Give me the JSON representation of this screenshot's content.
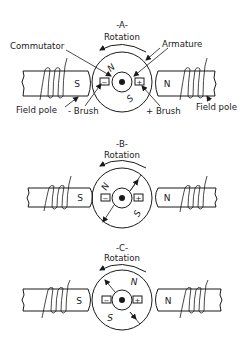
{
  "panels": [
    {
      "id": "A",
      "title": "-A-",
      "rotation_label": "Rotation",
      "field_pole_left_letter": "S",
      "field_pole_right_letter": "N",
      "armature_north": "N",
      "armature_south": "S",
      "brush_left_sign": "−",
      "brush_right_sign": "+",
      "callouts": {
        "commutator": "Commutator",
        "armature": "Armature",
        "field_pole_left": "Field pole",
        "field_pole_right": "Field pole",
        "neg_brush": "- Brush",
        "pos_brush": "+ Brush"
      }
    },
    {
      "id": "B",
      "title": "-B-",
      "rotation_label": "Rotation",
      "field_pole_left_letter": "S",
      "field_pole_right_letter": "N",
      "armature_north": "N",
      "armature_south": "S",
      "brush_left_sign": "−",
      "brush_right_sign": "+"
    },
    {
      "id": "C",
      "title": "-C-",
      "rotation_label": "Rotation",
      "field_pole_left_letter": "S",
      "field_pole_right_letter": "N",
      "armature_north": "N",
      "armature_south": "S",
      "brush_left_sign": "−",
      "brush_right_sign": "+"
    }
  ],
  "colors": {
    "ink": "#1a1a1a",
    "background": "#ffffff"
  }
}
